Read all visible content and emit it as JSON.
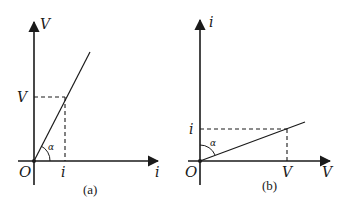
{
  "panels": [
    {
      "id": "a",
      "caption": "(a)",
      "y_axis_label": "V",
      "x_axis_label": "i",
      "origin_label": "O",
      "y_tick_label": "V",
      "x_tick_label": "i",
      "angle_label": "α",
      "description": "V vs i plot, steep line through origin; angle α measured from i-axis"
    },
    {
      "id": "b",
      "caption": "(b)",
      "y_axis_label": "i",
      "x_axis_label": "V",
      "origin_label": "O",
      "y_tick_label": "i",
      "x_tick_label": "V",
      "angle_label": "α",
      "description": "i vs V plot, shallow line through origin; angle α measured from i-axis"
    }
  ],
  "colors": {
    "ink": "#1a1a1a",
    "background": "#ffffff"
  }
}
